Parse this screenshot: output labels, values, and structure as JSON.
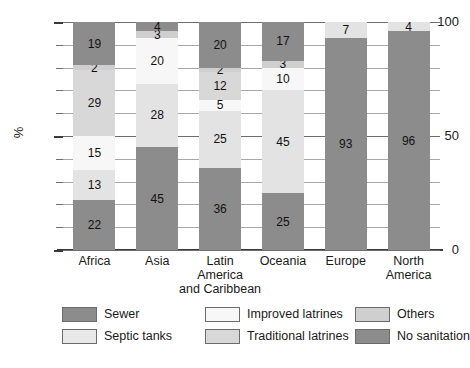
{
  "chart_data": {
    "type": "bar",
    "stacked": true,
    "title": "",
    "xlabel": "",
    "ylabel": "%",
    "ylim": [
      0,
      100
    ],
    "yticks": [
      0,
      10,
      20,
      30,
      40,
      50,
      60,
      70,
      80,
      90,
      100
    ],
    "ytick_labels_shown": [
      "0",
      "50",
      "100"
    ],
    "grid": true,
    "legend_position": "bottom",
    "categories": [
      "Africa",
      "Asia",
      "Latin America and Caribbean",
      "Oceania",
      "Europe",
      "North America"
    ],
    "category_lines": [
      [
        "Africa"
      ],
      [
        "Asia"
      ],
      [
        "Latin",
        "America",
        "and Caribbean"
      ],
      [
        "Oceania"
      ],
      [
        "Europe"
      ],
      [
        "North",
        "America"
      ]
    ],
    "series": [
      {
        "name": "Sewer",
        "color": "#8c8c8c",
        "values": [
          22,
          45,
          36,
          25,
          93,
          96
        ]
      },
      {
        "name": "Septic tanks",
        "color": "#e3e3e3",
        "values": [
          13,
          28,
          25,
          45,
          7,
          4
        ]
      },
      {
        "name": "Improved latrines",
        "color": "#f7f7f7",
        "values": [
          15,
          20,
          5,
          10,
          0,
          0
        ]
      },
      {
        "name": "Traditional latrines",
        "color": "#d8d8d8",
        "values": [
          29,
          0,
          12,
          0,
          0,
          0
        ]
      },
      {
        "name": "Others",
        "color": "#cfcfcf",
        "values": [
          2,
          3,
          2,
          3,
          0,
          0
        ]
      },
      {
        "name": "No sanitation",
        "color": "#8c8c8c",
        "values": [
          19,
          4,
          20,
          17,
          0,
          0
        ]
      }
    ]
  },
  "axis": {
    "y_label": "%",
    "y_top": "100",
    "y_mid": "50",
    "y_bottom": "0"
  },
  "legend": {
    "entries": [
      {
        "label": "Sewer",
        "color": "#8c8c8c"
      },
      {
        "label": "Improved latrines",
        "color": "#f7f7f7"
      },
      {
        "label": "Others",
        "color": "#cfcfcf"
      },
      {
        "label": "Septic tanks",
        "color": "#e8e8e8"
      },
      {
        "label": "Traditional latrines",
        "color": "#d8d8d8"
      },
      {
        "label": "No sanitation",
        "color": "#8c8c8c"
      }
    ]
  }
}
